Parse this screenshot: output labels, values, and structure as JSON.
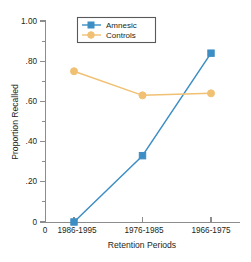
{
  "chart_data": {
    "type": "line",
    "title": "",
    "xlabel": "Retention Periods",
    "ylabel": "Proportion Recalled",
    "categories": [
      "1986-1995",
      "1976-1985",
      "1966-1975"
    ],
    "origin_label": "0",
    "ylim": [
      0,
      1.0
    ],
    "ytick_labels": [
      "0",
      ".20",
      ".40",
      ".60",
      ".80",
      "1.00"
    ],
    "ytick_values": [
      0,
      0.2,
      0.4,
      0.6,
      0.8,
      1.0
    ],
    "yminor_values": [
      0.1,
      0.3,
      0.5,
      0.7,
      0.9
    ],
    "grid": false,
    "legend_position": "top-center",
    "series": [
      {
        "name": "Amnesic",
        "color": "#3d8ec4",
        "values": [
          0.0,
          0.33,
          0.84
        ]
      },
      {
        "name": "Controls",
        "color": "#f0c173",
        "values": [
          0.75,
          0.63,
          0.64
        ]
      }
    ]
  },
  "legend": {
    "entries": [
      {
        "label": "Amnesic"
      },
      {
        "label": "Controls"
      }
    ]
  },
  "axes": {
    "y_title": "Proportion Recalled",
    "x_title": "Retention Periods",
    "y_labels": {
      "t0": "0",
      "t1": ".20",
      "t2": ".40",
      "t3": ".60",
      "t4": ".80",
      "t5": "1.00"
    },
    "x_labels": {
      "c0": "1986-1995",
      "c1": "1976-1985",
      "c2": "1966-1975"
    },
    "origin": "0"
  }
}
